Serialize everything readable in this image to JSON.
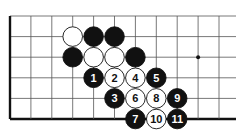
{
  "board": {
    "origin_x": 10,
    "origin_y": 16,
    "spacing_x": 20.9,
    "spacing_y": 20.6,
    "cols": 11,
    "rows": 6,
    "line_end_x": 236,
    "star_points": [
      {
        "col": 9,
        "row": 2
      }
    ],
    "colors": {
      "line": "#555555",
      "black": "#111111",
      "white": "#ffffff",
      "edge": "#111111"
    }
  },
  "stones": [
    {
      "color": "white",
      "col": 3,
      "row": 1,
      "label": ""
    },
    {
      "color": "black",
      "col": 4,
      "row": 1,
      "label": ""
    },
    {
      "color": "black",
      "col": 5,
      "row": 1,
      "label": ""
    },
    {
      "color": "black",
      "col": 3,
      "row": 2,
      "label": ""
    },
    {
      "color": "white",
      "col": 4,
      "row": 2,
      "label": ""
    },
    {
      "color": "white",
      "col": 5,
      "row": 2,
      "label": ""
    },
    {
      "color": "black",
      "col": 6,
      "row": 2,
      "label": ""
    },
    {
      "color": "black",
      "col": 4,
      "row": 3,
      "label": "1"
    },
    {
      "color": "white",
      "col": 5,
      "row": 3,
      "label": "2"
    },
    {
      "color": "black",
      "col": 5,
      "row": 4,
      "label": "3"
    },
    {
      "color": "white",
      "col": 6,
      "row": 3,
      "label": "4"
    },
    {
      "color": "black",
      "col": 7,
      "row": 3,
      "label": "5"
    },
    {
      "color": "white",
      "col": 6,
      "row": 4,
      "label": "6"
    },
    {
      "color": "black",
      "col": 6,
      "row": 5,
      "label": "7"
    },
    {
      "color": "white",
      "col": 7,
      "row": 4,
      "label": "8"
    },
    {
      "color": "black",
      "col": 8,
      "row": 4,
      "label": "9"
    },
    {
      "color": "white",
      "col": 7,
      "row": 5,
      "label": "10"
    },
    {
      "color": "black",
      "col": 8,
      "row": 5,
      "label": "11"
    }
  ]
}
